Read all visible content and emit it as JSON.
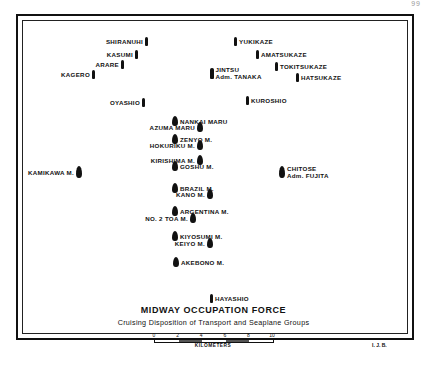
{
  "page_mark": "99",
  "title": "MIDWAY OCCUPATION FORCE",
  "subtitle": "Cruising Disposition of Transport and Seaplane Groups",
  "scale": {
    "ticks": [
      "0",
      "2",
      "4",
      "6",
      "8",
      "10"
    ],
    "unit": "KILOMETERS"
  },
  "initials": "I. J. B.",
  "ships": [
    {
      "id": "shiranuhi",
      "name": "SHIRANUHI",
      "x": 148,
      "y": 9,
      "side": "left",
      "type": "destroyer"
    },
    {
      "id": "yukikaze",
      "name": "YUKIKAZE",
      "x": 234,
      "y": 9,
      "side": "right",
      "type": "destroyer"
    },
    {
      "id": "kasumi",
      "name": "KASUMI",
      "x": 138,
      "y": 22,
      "side": "left",
      "type": "destroyer"
    },
    {
      "id": "amatsukaze",
      "name": "AMATSUKAZE",
      "x": 256,
      "y": 22,
      "side": "right",
      "type": "destroyer"
    },
    {
      "id": "arare",
      "name": "ARARE",
      "x": 124,
      "y": 32,
      "side": "left",
      "type": "destroyer"
    },
    {
      "id": "tokitsukaze",
      "name": "TOKITSUKAZE",
      "x": 275,
      "y": 34,
      "side": "right",
      "type": "destroyer"
    },
    {
      "id": "kagero",
      "name": "KAGERO",
      "x": 95,
      "y": 42,
      "side": "left",
      "type": "destroyer"
    },
    {
      "id": "jintsu",
      "name": "JINTSU",
      "name2": "Adm. TANAKA",
      "x": 210,
      "y": 38,
      "side": "right",
      "type": "cruiser"
    },
    {
      "id": "hatsukaze",
      "name": "HATSUKAZE",
      "x": 296,
      "y": 45,
      "side": "right",
      "type": "destroyer"
    },
    {
      "id": "oyashio",
      "name": "OYASHIO",
      "x": 145,
      "y": 70,
      "side": "left",
      "type": "destroyer"
    },
    {
      "id": "kuroshio",
      "name": "KUROSHIO",
      "x": 246,
      "y": 68,
      "side": "right",
      "type": "destroyer"
    },
    {
      "id": "nankai-maru",
      "name": "NANKAI MARU",
      "x": 172,
      "y": 88,
      "side": "right",
      "type": "transport"
    },
    {
      "id": "azuma-maru",
      "name": "AZUMA MARU",
      "x": 203,
      "y": 94,
      "side": "left",
      "type": "transport"
    },
    {
      "id": "zenyo-m",
      "name": "ZENYO M.",
      "x": 172,
      "y": 106,
      "side": "right",
      "type": "transport"
    },
    {
      "id": "hokuriku-m",
      "name": "HOKURIKU M.",
      "x": 203,
      "y": 112,
      "side": "left",
      "type": "transport"
    },
    {
      "id": "kirishima-m",
      "name": "KIRISHIMA M.",
      "x": 203,
      "y": 127,
      "side": "left",
      "type": "transport"
    },
    {
      "id": "goshu-m",
      "name": "GOSHU M.",
      "x": 172,
      "y": 133,
      "side": "right",
      "type": "transport"
    },
    {
      "id": "kamikawa-m",
      "name": "KAMIKAWA M.",
      "x": 82,
      "y": 138,
      "side": "left",
      "type": "seaplane"
    },
    {
      "id": "chitose",
      "name": "CHITOSE",
      "name2": "Adm. FUJITA",
      "x": 279,
      "y": 137,
      "side": "right",
      "type": "seaplane"
    },
    {
      "id": "brazil-m",
      "name": "BRAZIL M.",
      "x": 172,
      "y": 155,
      "side": "right",
      "type": "transport"
    },
    {
      "id": "kano-m",
      "name": "KANO M.",
      "x": 213,
      "y": 161,
      "side": "left",
      "type": "transport"
    },
    {
      "id": "argentina-m",
      "name": "ARGENTINA M.",
      "x": 172,
      "y": 178,
      "side": "right",
      "type": "transport"
    },
    {
      "id": "no2-toa-m",
      "name": "NO. 2 TOA M.",
      "x": 196,
      "y": 185,
      "side": "left",
      "type": "transport"
    },
    {
      "id": "kiyosumi-m",
      "name": "KIYOSUMI M.",
      "x": 172,
      "y": 203,
      "side": "right",
      "type": "transport"
    },
    {
      "id": "keiyo-m",
      "name": "KEIYO M.",
      "x": 213,
      "y": 210,
      "side": "left",
      "type": "transport"
    },
    {
      "id": "akebono-m",
      "name": "AKEBONO M.",
      "x": 173,
      "y": 229,
      "side": "right",
      "type": "transport"
    },
    {
      "id": "hayashio",
      "name": "HAYASHIO",
      "x": 210,
      "y": 266,
      "side": "right",
      "type": "destroyer"
    }
  ]
}
